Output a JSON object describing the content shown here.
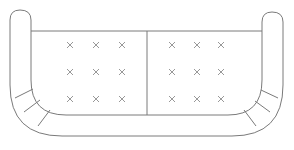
{
  "diagram": {
    "stroke_color": "#7a7a7a",
    "background": "#ffffff",
    "cushions": [
      {
        "name": "left-seat-cushion",
        "x": 31,
        "y": 31,
        "w": 116,
        "h": 84,
        "tufts": [
          [
            70,
            45
          ],
          [
            96,
            45
          ],
          [
            122,
            45
          ],
          [
            70,
            72
          ],
          [
            96,
            72
          ],
          [
            122,
            72
          ],
          [
            70,
            99
          ],
          [
            96,
            99
          ],
          [
            122,
            99
          ]
        ]
      },
      {
        "name": "right-seat-cushion",
        "x": 147,
        "y": 31,
        "w": 115,
        "h": 84,
        "tufts": [
          [
            172,
            45
          ],
          [
            197,
            45
          ],
          [
            221,
            45
          ],
          [
            172,
            72
          ],
          [
            197,
            72
          ],
          [
            221,
            72
          ],
          [
            172,
            99
          ],
          [
            197,
            99
          ],
          [
            221,
            99
          ]
        ]
      }
    ],
    "tuft_symbol": "×"
  }
}
